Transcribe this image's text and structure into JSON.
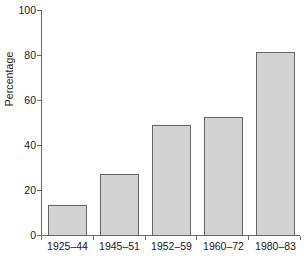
{
  "chart_data": {
    "type": "bar",
    "title": "",
    "xlabel": "",
    "ylabel": "Percentage",
    "categories": [
      "1925–44",
      "1945–51",
      "1952–59",
      "1960–72",
      "1980–83"
    ],
    "values": [
      13.5,
      27,
      49,
      52.5,
      81.5
    ],
    "ylim": [
      0,
      100
    ],
    "yticks": [
      0,
      20,
      40,
      60,
      80,
      100
    ],
    "ytick_labels": [
      "0",
      "20",
      "40",
      "60",
      "80",
      "100"
    ],
    "grid": false,
    "legend": null,
    "series": [
      {
        "name": "Percentage",
        "values": [
          13.5,
          27,
          49,
          52.5,
          81.5
        ]
      }
    ]
  },
  "style": {
    "bar_fill": "#d3d3d3",
    "bar_border": "#666666",
    "axis_color": "#6a6a6a",
    "text_color": "#1a1a1a",
    "background": "#ffffff"
  }
}
